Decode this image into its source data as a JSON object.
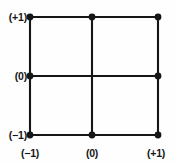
{
  "figure": {
    "type": "grid-lattice-diagram",
    "background_color": "#fefefe",
    "line_color": "#161616",
    "node_color": "#161616",
    "line_width": 2,
    "node_radius": 3.4
  },
  "axes": {
    "y_axis": {
      "name": "vertical-axis",
      "ticks": [
        {
          "id": "y-top",
          "label": "(+1)",
          "value": 1,
          "pixel_y": 17
        },
        {
          "id": "y-mid",
          "label": "(0)",
          "value": 0,
          "pixel_y": 76
        },
        {
          "id": "y-bot",
          "label": "(−1)",
          "value": -1,
          "pixel_y": 135
        }
      ]
    },
    "x_axis": {
      "name": "horizontal-axis",
      "ticks": [
        {
          "id": "x-left",
          "label": "(−1)",
          "value": -1,
          "pixel_x": 30
        },
        {
          "id": "x-mid",
          "label": "(0)",
          "value": 0,
          "pixel_x": 92
        },
        {
          "id": "x-right",
          "label": "(+1)",
          "value": 1,
          "pixel_x": 158
        }
      ]
    }
  },
  "grid": {
    "left": 30,
    "center_x": 92,
    "right": 158,
    "top": 17,
    "center_y": 76,
    "bottom": 135,
    "lines": [
      {
        "id": "line-top",
        "orientation": "horizontal",
        "x1": 30,
        "y1": 17,
        "x2": 158,
        "y2": 17
      },
      {
        "id": "line-middle-horizontal",
        "orientation": "horizontal",
        "x1": 30,
        "y1": 76,
        "x2": 158,
        "y2": 76
      },
      {
        "id": "line-bottom",
        "orientation": "horizontal",
        "x1": 30,
        "y1": 135,
        "x2": 158,
        "y2": 135
      },
      {
        "id": "line-left",
        "orientation": "vertical",
        "x1": 30,
        "y1": 17,
        "x2": 30,
        "y2": 135
      },
      {
        "id": "line-middle-vertical",
        "orientation": "vertical",
        "x1": 92,
        "y1": 17,
        "x2": 92,
        "y2": 135
      },
      {
        "id": "line-right",
        "orientation": "vertical",
        "x1": 158,
        "y1": 17,
        "x2": 158,
        "y2": 135
      }
    ],
    "nodes": [
      {
        "id": "node-top-left",
        "coord": "(-1,+1)",
        "cx": 30,
        "cy": 17
      },
      {
        "id": "node-top-center",
        "coord": "(0,+1)",
        "cx": 92,
        "cy": 17
      },
      {
        "id": "node-top-right",
        "coord": "(+1,+1)",
        "cx": 158,
        "cy": 17
      },
      {
        "id": "node-middle-left",
        "coord": "(-1,0)",
        "cx": 30,
        "cy": 76
      },
      {
        "id": "node-middle-right",
        "coord": "(+1,0)",
        "cx": 158,
        "cy": 76
      },
      {
        "id": "node-bottom-left",
        "coord": "(-1,-1)",
        "cx": 30,
        "cy": 135
      },
      {
        "id": "node-bottom-center",
        "coord": "(0,-1)",
        "cx": 92,
        "cy": 135
      },
      {
        "id": "node-bottom-right",
        "coord": "(+1,-1)",
        "cx": 158,
        "cy": 135
      }
    ]
  }
}
